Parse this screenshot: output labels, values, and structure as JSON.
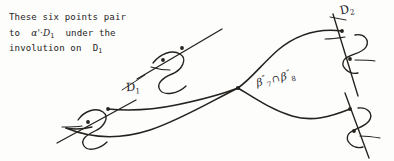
{
  "page": {
    "width": 394,
    "height": 161,
    "background_color": "#fdfdfc",
    "ink_color": "#24221f"
  },
  "annotation": {
    "line1": "These six points pair",
    "line2_part1": "to",
    "line2_alpha": "α'·D",
    "line2_sub": "1",
    "line2_part2": "under the",
    "line3_part1": "involution on",
    "line3_d": "D",
    "line3_sub": "1",
    "full_text": "These six points pair to α'·D1 under the involution on D1"
  },
  "labels": {
    "d1": {
      "base": "D",
      "sub": "1"
    },
    "d2": {
      "base": "D",
      "sub": "2"
    },
    "beta": {
      "left_base": "β",
      "left_prime": "″",
      "left_sub": "7",
      "intersect": "∩",
      "right_base": "β",
      "right_prime": "″",
      "right_sub": "8",
      "full_text": "β″7 ∩ β″8"
    }
  },
  "diagram": {
    "type": "hand-drawn-curve-diagram",
    "node_count": 4,
    "marked_point_count": 6,
    "curves": [
      {
        "name": "D1",
        "label_position": "left-center"
      },
      {
        "name": "D2",
        "label_position": "top-right"
      }
    ],
    "central_crossing_label": "β″7 ∩ β″8"
  }
}
